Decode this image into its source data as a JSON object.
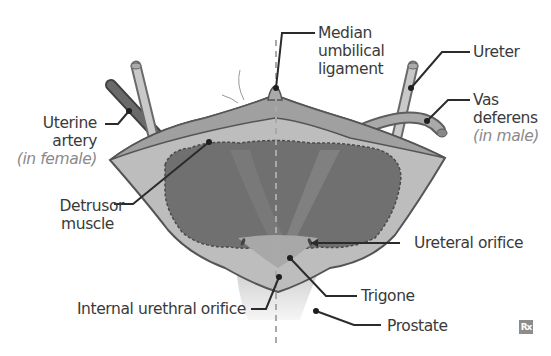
{
  "diagram": {
    "labels": {
      "median_umbilical_ligament": [
        "Median",
        "umbilical",
        "ligament"
      ],
      "ureter": "Ureter",
      "vas_deferens": [
        "Vas",
        "deferens"
      ],
      "vas_deferens_note": "(in male)",
      "uterine_artery": [
        "Uterine",
        "artery"
      ],
      "uterine_artery_note": "(in female)",
      "detrusor_muscle": [
        "Detrusor",
        "muscle"
      ],
      "ureteral_orifice": "Ureteral orifice",
      "trigone": "Trigone",
      "internal_urethral_orifice": "Internal urethral orifice",
      "prostate": "Prostate"
    },
    "watermark": "Rx",
    "colors": {
      "outer_wall": "#bdbdbd",
      "wall_outline": "#555555",
      "detrusor": "#707070",
      "trigone": "#a8a8a8",
      "prostate": "#e9e9e9",
      "vessel_dark": "#5e5e5e",
      "vessel_light": "#c9c9c9",
      "leader": "#2b2b2b",
      "label_text": "#3a3a3a",
      "note_text": "#8a8a8a"
    }
  }
}
